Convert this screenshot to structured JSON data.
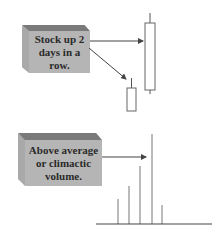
{
  "callouts": [
    {
      "label_line1": "Stock up 2",
      "label_line2": "days in a",
      "label_line3": "row."
    },
    {
      "label_line1": "Above average",
      "label_line2": "or climactic",
      "label_line3": "volume."
    }
  ],
  "colors": {
    "box_front": "#b5b5b5",
    "box_top": "#7a7a7a",
    "box_side": "#a9a9a9",
    "line": "#444444"
  },
  "candles": [
    {
      "name": "small-candle",
      "wick_top": 78,
      "body_top": 88,
      "body_bottom": 111,
      "x": 127,
      "w": 9
    },
    {
      "name": "large-candle",
      "wick_top": 13,
      "body_top": 23,
      "body_bottom": 90,
      "wick_bottom": 94,
      "x": 145,
      "w": 10
    }
  ],
  "volume_bars": [
    {
      "x": 118,
      "top": 199
    },
    {
      "x": 129,
      "top": 186
    },
    {
      "x": 140,
      "top": 166
    },
    {
      "x": 152,
      "top": 134
    },
    {
      "x": 162,
      "top": 205
    }
  ],
  "volume_baseline": {
    "y": 224,
    "x1": 96,
    "x2": 212
  }
}
